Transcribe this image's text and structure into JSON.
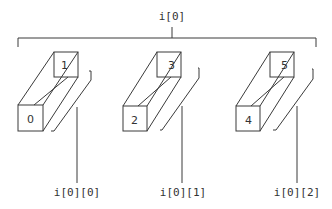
{
  "diagram": {
    "title": "i[0]",
    "line_color": "#3a3a3a",
    "elements": [
      {
        "front_label": "0",
        "back_label": "1",
        "sub_label": "i[0][0]"
      },
      {
        "front_label": "2",
        "back_label": "3",
        "sub_label": "i[0][1]"
      },
      {
        "front_label": "4",
        "back_label": "5",
        "sub_label": "i[0][2]"
      }
    ]
  }
}
